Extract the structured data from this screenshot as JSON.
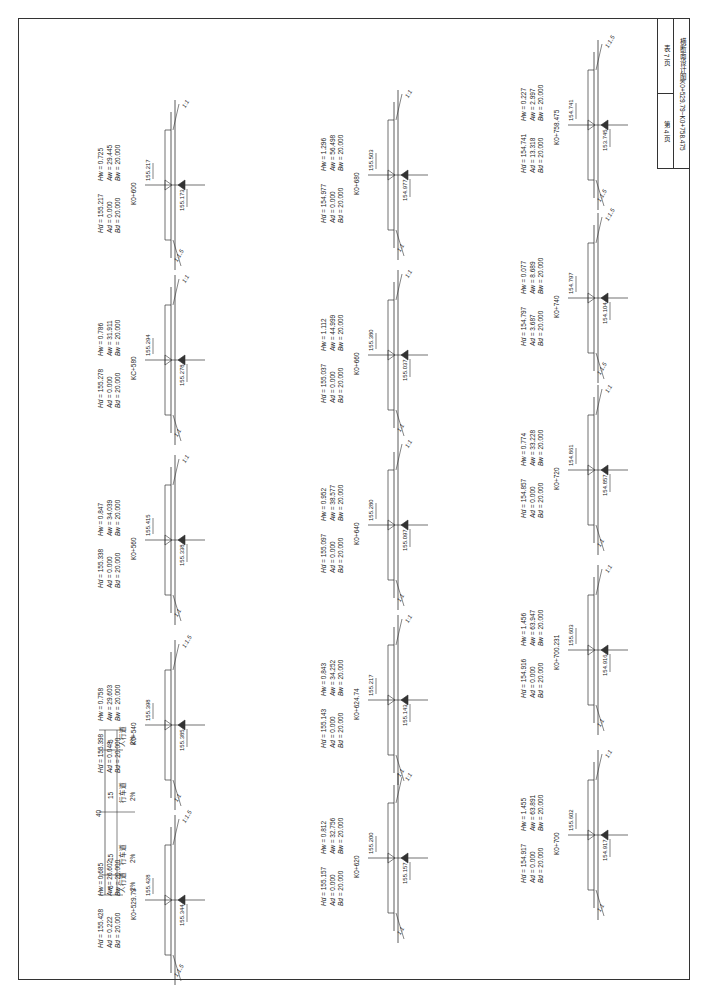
{
  "title_block": {
    "sheet": "第 4 页",
    "table": "表 7 页",
    "subtitle": "横断面设计图",
    "range": "K0+529.79~K0+758.475"
  },
  "columns": [
    {
      "sections": [
        {
          "station": "K0+758.475",
          "left_elev": "154.741",
          "right_elev": "153.745",
          "Hd": "154.741",
          "Ad": "13.318",
          "Bd": "20.000",
          "Hw": "0.227",
          "Aw": "2.997",
          "Bw": "20.000",
          "slope_top": "1:1.5",
          "slope_bottom": "1:1.5"
        },
        {
          "station": "K0+740",
          "left_elev": "154.797",
          "right_elev": "154.104",
          "Hd": "154.797",
          "Ad": "3.687",
          "Bd": "20.000",
          "Hw": "0.077",
          "Aw": "8.689",
          "Bw": "20.000",
          "slope_top": "1:1.5",
          "slope_bottom": "1:1.5"
        },
        {
          "station": "K0+720",
          "left_elev": "154.861",
          "right_elev": "154.857",
          "Hd": "154.857",
          "Ad": "0.000",
          "Bd": "20.000",
          "Hw": "0.774",
          "Aw": "33.228",
          "Bw": "20.000",
          "slope_top": "1:1",
          "slope_bottom": "1:1"
        },
        {
          "station": "K0+700.231",
          "left_elev": "155.603",
          "right_elev": "154.916",
          "Hd": "154.916",
          "Ad": "0.000",
          "Bd": "20.000",
          "Hw": "1.456",
          "Aw": "63.947",
          "Bw": "20.000",
          "slope_top": "1:1",
          "slope_bottom": "1:1"
        },
        {
          "station": "K0+700",
          "left_elev": "155.602",
          "right_elev": "154.917",
          "Hd": "154.917",
          "Ad": "0.000",
          "Bd": "20.000",
          "Hw": "1.455",
          "Aw": "63.891",
          "Bw": "20.000",
          "slope_top": "1:1",
          "slope_bottom": "1:1"
        }
      ]
    },
    {
      "sections": [
        {
          "station": "K0+680",
          "left_elev": "155.503",
          "right_elev": "154.977",
          "Hd": "154.977",
          "Ad": "0.000",
          "Bd": "20.000",
          "Hw": "1.296",
          "Aw": "56.498",
          "Bw": "20.000",
          "slope_top": "1:1",
          "slope_bottom": "1:1"
        },
        {
          "station": "K0+660",
          "left_elev": "155.380",
          "right_elev": "155.037",
          "Hd": "155.037",
          "Ad": "0.000",
          "Bd": "20.000",
          "Hw": "1.112",
          "Aw": "44.999",
          "Bw": "20.000",
          "slope_top": "1:1",
          "slope_bottom": "1:1"
        },
        {
          "station": "K0+640",
          "left_elev": "155.280",
          "right_elev": "155.097",
          "Hd": "155.097",
          "Ad": "0.000",
          "Bd": "20.000",
          "Hw": "0.952",
          "Aw": "38.577",
          "Bw": "20.000",
          "slope_top": "1:1",
          "slope_bottom": "1:1"
        },
        {
          "station": "K0+624.74",
          "left_elev": "155.217",
          "right_elev": "155.143",
          "Hd": "155.143",
          "Ad": "0.000",
          "Bd": "20.000",
          "Hw": "0.843",
          "Aw": "34.252",
          "Bw": "20.000",
          "slope_top": "1:1",
          "slope_bottom": "1:1"
        },
        {
          "station": "K0+620",
          "left_elev": "155.200",
          "right_elev": "155.157",
          "Hd": "155.157",
          "Ad": "0.000",
          "Bd": "20.000",
          "Hw": "0.812",
          "Aw": "32.756",
          "Bw": "20.000",
          "slope_top": "1:1",
          "slope_bottom": "1:1"
        }
      ]
    },
    {
      "sections": [
        {
          "station": "K0+600",
          "left_elev": "155.217",
          "right_elev": "155.173",
          "Hd": "155.217",
          "Ad": "0.000",
          "Bd": "20.000",
          "Hw": "0.725",
          "Aw": "29.445",
          "Bw": "20.000",
          "slope_top": "1:1",
          "slope_bottom": "1:1.5"
        },
        {
          "station": "KC+580",
          "left_elev": "155.294",
          "right_elev": "155.278",
          "Hd": "155.278",
          "Ad": "0.000",
          "Bd": "20.000",
          "Hw": "0.786",
          "Aw": "31.911",
          "Bw": "20.000",
          "slope_top": "1:1",
          "slope_bottom": "1:1"
        },
        {
          "station": "K0+560",
          "left_elev": "155.415",
          "right_elev": "155.338",
          "Hd": "155.338",
          "Ad": "0.000",
          "Bd": "20.000",
          "Hw": "0.847",
          "Aw": "34.039",
          "Bw": "20.000",
          "slope_top": "1:1",
          "slope_bottom": "1:1"
        },
        {
          "station": "K0+540",
          "left_elev": "155.398",
          "right_elev": "155.385",
          "Hd": "155.398",
          "Ad": "0.048",
          "Bd": "20.000",
          "Hw": "0.758",
          "Aw": "29.603",
          "Bw": "20.000",
          "slope_top": "1:1.5",
          "slope_bottom": "1:1"
        },
        {
          "station": "K0+529.79",
          "left_elev": "155.428",
          "right_elev": "155.344",
          "Hd": "155.428",
          "Ad": "0.222",
          "Bd": "20.000",
          "Hw": "0.685",
          "Aw": "26.602",
          "Bw": "20.000",
          "slope_top": "1:1.5",
          "slope_bottom": "1:1.5"
        }
      ]
    }
  ],
  "typical_section": {
    "total_width": "40",
    "parts": [
      {
        "width": "5",
        "label": "人行道",
        "slope": "2%"
      },
      {
        "width": "15",
        "label": "行车道",
        "slope": "2%"
      },
      {
        "width": "15",
        "label": "行车道",
        "slope": "2%"
      },
      {
        "width": "5",
        "label": "人行道",
        "slope": "2%"
      }
    ]
  },
  "labels": {
    "H_fill": "Hd =",
    "A_fill": "Ad =",
    "B_fill": "Bd =",
    "H_cut": "Hw =",
    "A_cut": "Aw =",
    "B_cut": "Bw ="
  },
  "colors": {
    "line": "#333333",
    "paper": "#ffffff"
  }
}
